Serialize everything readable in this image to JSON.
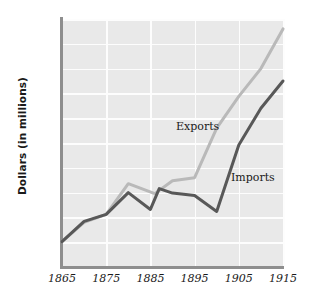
{
  "chart_data": {
    "type": "line",
    "title": "",
    "xlabel": "",
    "ylabel": "Dollars (in millions)",
    "xlim": [
      1865,
      1915
    ],
    "ylim": [
      0,
      2500
    ],
    "grid": true,
    "legend_position": "inline-annotations",
    "xticks": [
      "1865",
      "1875",
      "1885",
      "1895",
      "1905",
      "1915"
    ],
    "xtick_values": [
      1865,
      1875,
      1885,
      1895,
      1905,
      1915
    ],
    "yticks": [
      "250",
      "500",
      "750",
      "1000",
      "1250",
      "1500",
      "1750",
      "2000",
      "2250",
      "2500"
    ],
    "ytick_values": [
      250,
      500,
      750,
      1000,
      1250,
      1500,
      1750,
      2000,
      2250,
      2500
    ],
    "series": [
      {
        "name": "Exports",
        "color": "#b9b9b9",
        "x": [
          1865,
          1870,
          1875,
          1880,
          1883,
          1886,
          1890,
          1895,
          1900,
          1905,
          1910,
          1915
        ],
        "values": [
          255,
          450,
          530,
          840,
          790,
          740,
          870,
          900,
          1400,
          1720,
          2000,
          2400
        ]
      },
      {
        "name": "Imports",
        "color": "#585858",
        "x": [
          1865,
          1870,
          1875,
          1880,
          1885,
          1887,
          1890,
          1895,
          1900,
          1905,
          1910,
          1915
        ],
        "values": [
          255,
          460,
          530,
          750,
          580,
          790,
          745,
          720,
          560,
          1230,
          1600,
          1875
        ]
      }
    ]
  },
  "axis": {
    "y_title": "Dollars (in millions)"
  },
  "annotations": {
    "exports_label": "Exports",
    "imports_label": "Imports"
  },
  "colors": {
    "plot_background": "#e9e9e9",
    "gridline": "#fdfdfd",
    "axis": "#8e8e8e",
    "exports_line": "#b9b9b9",
    "imports_line": "#585858",
    "text": "#1a1a1a"
  }
}
